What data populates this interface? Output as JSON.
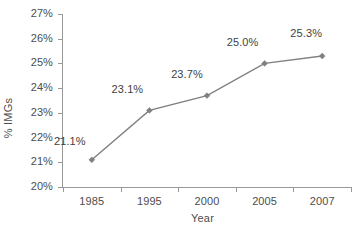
{
  "chart_data": {
    "type": "line",
    "title": "",
    "xlabel": "Year",
    "ylabel": "% IMGs",
    "categories": [
      "1985",
      "1995",
      "2000",
      "2005",
      "2007"
    ],
    "values": [
      21.1,
      23.1,
      23.7,
      25.0,
      25.3
    ],
    "point_labels": [
      "21.1%",
      "23.1%",
      "23.7%",
      "25.0%",
      "25.3%"
    ],
    "ylim": [
      20,
      27
    ],
    "ytick_values": [
      20,
      21,
      22,
      23,
      24,
      25,
      26,
      27
    ],
    "ytick_labels": [
      "20%",
      "21%",
      "22%",
      "23%",
      "24%",
      "25%",
      "26%",
      "27%"
    ],
    "grid": false,
    "legend": false,
    "series": [
      {
        "name": "% IMGs",
        "values": [
          21.1,
          23.1,
          23.7,
          25.0,
          25.3
        ],
        "color": "#808080",
        "marker": "diamond"
      }
    ],
    "colors": {
      "line": "#808080",
      "marker": "#808080",
      "axis": "#999999",
      "text": "#4d4d4d",
      "label_text": "#3f3f3f",
      "background": "#ffffff"
    }
  }
}
